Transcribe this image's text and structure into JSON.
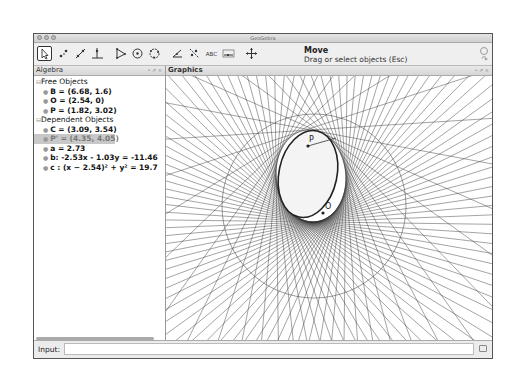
{
  "window": {
    "title": "GeoGebra"
  },
  "toolbar": {
    "tools": [
      {
        "name": "move-tool",
        "selected": true
      },
      {
        "name": "point-tool"
      },
      {
        "name": "line-tool"
      },
      {
        "name": "perpendicular-line-tool"
      },
      {
        "name": "polygon-tool"
      },
      {
        "name": "circle-tool"
      },
      {
        "name": "circle-three-points-tool"
      },
      {
        "name": "angle-tool"
      },
      {
        "name": "reflect-tool"
      },
      {
        "name": "text-tool",
        "label": "ABC"
      },
      {
        "name": "slider-tool",
        "label": "a=2"
      },
      {
        "name": "move-graphics-tool"
      }
    ],
    "active_tool_title": "Move",
    "active_tool_description": "Drag or select objects (Esc)"
  },
  "algebra": {
    "title": "Algebra",
    "groups": [
      {
        "label": "Free Objects",
        "items": [
          {
            "text": "B = (6.68, 1.6)"
          },
          {
            "text": "O = (2.54, 0)"
          },
          {
            "text": "P = (1.82, 3.02)"
          }
        ]
      },
      {
        "label": "Dependent Objects",
        "items": [
          {
            "text": "C = (3.09, 3.54)"
          },
          {
            "text": "P' = (4.35, 4.05)",
            "highlighted": true
          },
          {
            "text": "a = 2.73"
          },
          {
            "text": "b: -2.53x - 1.03y = -11.46"
          },
          {
            "text": "c : (x − 2.54)² + y² = 19.7"
          }
        ]
      }
    ]
  },
  "graphics": {
    "title": "Graphics",
    "labels": {
      "P": "P",
      "O": "O"
    }
  },
  "input": {
    "label": "Input:",
    "value": ""
  }
}
